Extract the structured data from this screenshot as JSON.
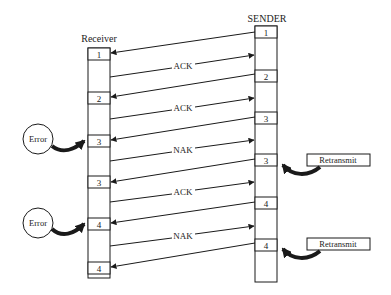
{
  "receiver": {
    "title": "Receiver",
    "frames": [
      "1",
      "2",
      "3",
      "3",
      "4",
      "4"
    ]
  },
  "sender": {
    "title": "SENDER",
    "frames": [
      "1",
      "2",
      "3",
      "3",
      "4",
      "4"
    ]
  },
  "responses": [
    "ACK",
    "ACK",
    "NAK",
    "ACK",
    "NAK"
  ],
  "errors": [
    "Error",
    "Error"
  ],
  "retransmits": [
    "Retransmit",
    "Retransmit"
  ],
  "colors": {
    "line": "#1a1a1a",
    "background": "#ffffff"
  }
}
